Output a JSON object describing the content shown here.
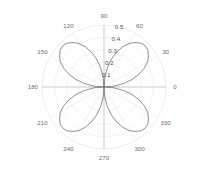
{
  "chart_data": {
    "type": "line",
    "subtype": "polar-rose",
    "title": "",
    "xlabel": "",
    "ylabel": "",
    "grid": true,
    "legend": null,
    "projection": "polar",
    "angle_unit": "degrees",
    "theta_zero_location": "E",
    "theta_direction": "counterclockwise",
    "angular_ticks": [
      0,
      30,
      60,
      90,
      120,
      150,
      180,
      210,
      240,
      270,
      300,
      330
    ],
    "angular_tick_labels": [
      "0",
      "30",
      "60",
      "90",
      "120",
      "150",
      "180",
      "210",
      "240",
      "270",
      "300",
      "330"
    ],
    "radial_ticks": [
      0.1,
      0.2,
      0.3,
      0.4,
      0.5
    ],
    "radial_tick_labels": [
      "0.1",
      "0.2",
      "0.3",
      "0.4",
      "0.5"
    ],
    "rlim": [
      0,
      0.5
    ],
    "radial_label_angle": 75,
    "equation": "r = 0.47 * |cos(2*theta)| rotated 45deg",
    "petal_count": 4,
    "petal_peak_angles": [
      45,
      135,
      225,
      315
    ],
    "petal_peak_radius": 0.47,
    "series": [
      {
        "name": "rose",
        "color": "#6b6b6b",
        "theta": [
          0,
          5,
          10,
          15,
          20,
          25,
          30,
          35,
          40,
          45,
          50,
          55,
          60,
          65,
          70,
          75,
          80,
          85,
          90,
          95,
          100,
          105,
          110,
          115,
          120,
          125,
          130,
          135,
          140,
          145,
          150,
          155,
          160,
          165,
          170,
          175,
          180,
          185,
          190,
          195,
          200,
          205,
          210,
          215,
          220,
          225,
          230,
          235,
          240,
          245,
          250,
          255,
          260,
          265,
          270,
          275,
          280,
          285,
          290,
          295,
          300,
          305,
          310,
          315,
          320,
          325,
          330,
          335,
          340,
          345,
          350,
          355,
          360
        ],
        "r": [
          0.0,
          0.082,
          0.161,
          0.235,
          0.301,
          0.358,
          0.407,
          0.437,
          0.462,
          0.47,
          0.462,
          0.437,
          0.407,
          0.358,
          0.301,
          0.235,
          0.161,
          0.082,
          0.0,
          0.082,
          0.161,
          0.235,
          0.301,
          0.358,
          0.407,
          0.437,
          0.462,
          0.47,
          0.462,
          0.437,
          0.407,
          0.358,
          0.301,
          0.235,
          0.161,
          0.082,
          0.0,
          0.082,
          0.161,
          0.235,
          0.301,
          0.358,
          0.407,
          0.437,
          0.462,
          0.47,
          0.462,
          0.437,
          0.407,
          0.358,
          0.301,
          0.235,
          0.161,
          0.082,
          0.0,
          0.082,
          0.161,
          0.235,
          0.301,
          0.358,
          0.407,
          0.437,
          0.462,
          0.47,
          0.462,
          0.437,
          0.407,
          0.358,
          0.301,
          0.235,
          0.161,
          0.082,
          0.0
        ]
      }
    ]
  },
  "colors": {
    "background": "#fefefe",
    "grid": "#e6e6e6",
    "axis": "#b8b8b8",
    "curve": "#6b6b6b",
    "tick_text": "#6e6e6e"
  },
  "geometry": {
    "center_x": 104,
    "center_y": 87,
    "outer_radius": 62
  }
}
